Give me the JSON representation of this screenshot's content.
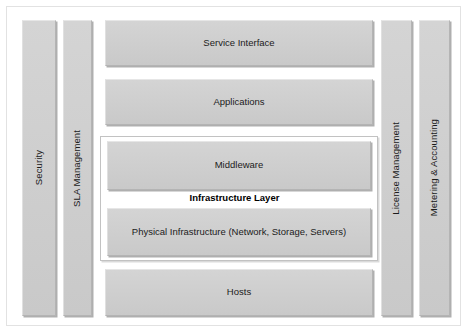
{
  "diagram": {
    "colors": {
      "box_fill": "#cfcfcf",
      "box_border": "#b4b4b4",
      "group_fill": "#ffffff",
      "group_border": "#c2c2c2",
      "frame_border": "#e2e2e2",
      "text": "#1b1b1b"
    },
    "left_pillars": [
      {
        "label": "Security"
      },
      {
        "label": "SLA Management"
      }
    ],
    "right_pillars": [
      {
        "label": "License Management"
      },
      {
        "label": "Metering & Accounting"
      }
    ],
    "center_layers": [
      {
        "label": "Service Interface"
      },
      {
        "label": "Applications"
      },
      {
        "label": "Middleware"
      },
      {
        "label": "Physical Infrastructure (Network, Storage, Servers)"
      },
      {
        "label": "Hosts"
      }
    ],
    "group": {
      "caption": "Infrastructure Layer"
    }
  }
}
